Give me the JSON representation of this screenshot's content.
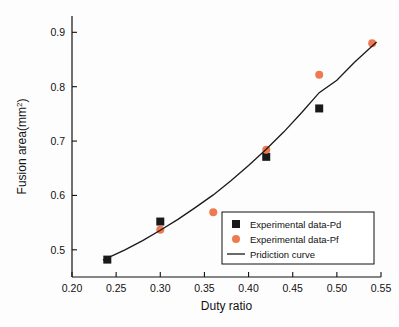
{
  "chart_data": {
    "type": "scatter",
    "title": "",
    "xlabel": "Duty ratio",
    "ylabel": "Fusion area(mm²)",
    "ylabel_main": "Fusion area(mm",
    "ylabel_sup": "2",
    "ylabel_close": ")",
    "xlim": [
      0.2,
      0.55
    ],
    "ylim": [
      0.45,
      0.93
    ],
    "xticks": [
      "0.20",
      "0.25",
      "0.30",
      "0.35",
      "0.40",
      "0.45",
      "0.50",
      "0.55"
    ],
    "xtick_values": [
      0.2,
      0.25,
      0.3,
      0.35,
      0.4,
      0.45,
      0.5,
      0.55
    ],
    "yticks": [
      "0.5",
      "0.6",
      "0.7",
      "0.8",
      "0.9"
    ],
    "ytick_values": [
      0.5,
      0.6,
      0.7,
      0.8,
      0.9
    ],
    "grid": false,
    "legend_position": "lower right",
    "series": [
      {
        "name": "Experimental data-Pd",
        "marker": "square",
        "color": "#1a1a1a",
        "points": [
          {
            "x": 0.24,
            "y": 0.482
          },
          {
            "x": 0.3,
            "y": 0.552
          },
          {
            "x": 0.42,
            "y": 0.671
          },
          {
            "x": 0.48,
            "y": 0.76
          }
        ]
      },
      {
        "name": "Experimental data-Pf",
        "marker": "circle",
        "color": "#ef7a52",
        "points": [
          {
            "x": 0.3,
            "y": 0.537
          },
          {
            "x": 0.36,
            "y": 0.569
          },
          {
            "x": 0.42,
            "y": 0.684
          },
          {
            "x": 0.48,
            "y": 0.822
          },
          {
            "x": 0.54,
            "y": 0.88
          }
        ]
      },
      {
        "name": "Pridiction curve",
        "marker": "line",
        "color": "#1a1a1a",
        "points": [
          {
            "x": 0.235,
            "y": 0.481
          },
          {
            "x": 0.26,
            "y": 0.5
          },
          {
            "x": 0.28,
            "y": 0.517
          },
          {
            "x": 0.3,
            "y": 0.536
          },
          {
            "x": 0.32,
            "y": 0.556
          },
          {
            "x": 0.34,
            "y": 0.578
          },
          {
            "x": 0.36,
            "y": 0.601
          },
          {
            "x": 0.38,
            "y": 0.627
          },
          {
            "x": 0.4,
            "y": 0.655
          },
          {
            "x": 0.42,
            "y": 0.685
          },
          {
            "x": 0.44,
            "y": 0.717
          },
          {
            "x": 0.46,
            "y": 0.752
          },
          {
            "x": 0.48,
            "y": 0.789
          },
          {
            "x": 0.5,
            "y": 0.812
          },
          {
            "x": 0.52,
            "y": 0.845
          },
          {
            "x": 0.545,
            "y": 0.882
          }
        ]
      }
    ],
    "legend": [
      {
        "label": "Experimental data-Pd",
        "marker": "square",
        "color": "#1a1a1a"
      },
      {
        "label": "Experimental data-Pf",
        "marker": "circle",
        "color": "#ef7a52"
      },
      {
        "label": "Pridiction curve",
        "marker": "line",
        "color": "#1a1a1a"
      }
    ]
  }
}
